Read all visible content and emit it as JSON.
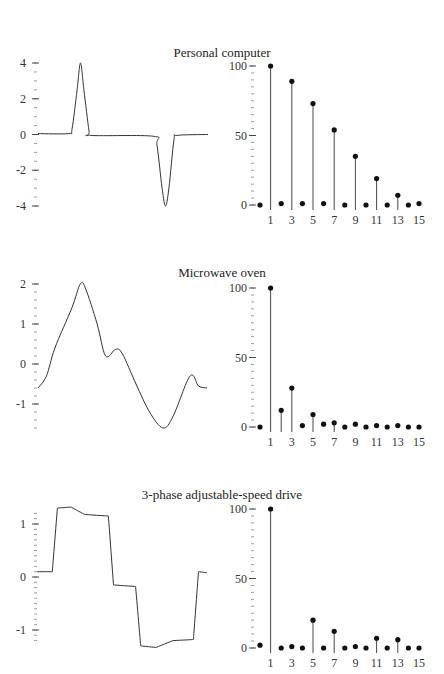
{
  "figure": {
    "panels": [
      {
        "title": "Personal computer"
      },
      {
        "title": "Microwave oven"
      },
      {
        "title": "3-phase adjustable-speed drive"
      }
    ]
  },
  "chart_data": [
    {
      "type": "line",
      "title": "Personal computer — current waveform",
      "xlabel": "",
      "ylabel": "",
      "yticks": [
        4,
        2,
        0,
        -2,
        -4
      ],
      "ylim": [
        -4,
        4
      ],
      "description": "Flat at ~0, sharp positive pulse peaking at ~4 near 25% of the cycle, flat ~0, sharp negative pulse reaching ~-4 near 75% of the cycle, back to 0",
      "points": [
        [
          0,
          0.05
        ],
        [
          0.18,
          0.05
        ],
        [
          0.2,
          0.3
        ],
        [
          0.23,
          2.5
        ],
        [
          0.25,
          4.0
        ],
        [
          0.27,
          2.5
        ],
        [
          0.3,
          0.2
        ],
        [
          0.31,
          -0.05
        ],
        [
          0.68,
          -0.1
        ],
        [
          0.7,
          -0.6
        ],
        [
          0.73,
          -3.0
        ],
        [
          0.75,
          -4.0
        ],
        [
          0.77,
          -3.0
        ],
        [
          0.8,
          -0.3
        ],
        [
          0.82,
          -0.05
        ],
        [
          1.0,
          0
        ]
      ]
    },
    {
      "type": "bar",
      "subtype": "stem",
      "title": "Personal computer — harmonic spectrum",
      "x_ticks": [
        1,
        3,
        5,
        7,
        9,
        11,
        13,
        15
      ],
      "yticks": [
        0,
        50,
        100
      ],
      "ylim": [
        0,
        100
      ],
      "categories": [
        0,
        1,
        2,
        3,
        4,
        5,
        6,
        7,
        8,
        9,
        10,
        11,
        12,
        13,
        14,
        15
      ],
      "values": [
        0,
        100,
        1,
        89,
        1,
        73,
        1,
        54,
        0,
        35,
        0,
        19,
        0,
        7,
        -1,
        1
      ]
    },
    {
      "type": "line",
      "title": "Microwave oven — current waveform",
      "yticks": [
        2,
        1,
        0,
        -1
      ],
      "ylim": [
        -1.6,
        2
      ],
      "description": "Distorted sinusoid: starts ~-0.6, rises to peak ~2, falls to ~0.2 with a small bump to ~0.35, drops to trough ~-1.6, rises to ~-0.3 then dips to ~-0.6",
      "points": [
        [
          0,
          -0.6
        ],
        [
          0.05,
          -0.3
        ],
        [
          0.1,
          0.4
        ],
        [
          0.2,
          1.4
        ],
        [
          0.25,
          2.0
        ],
        [
          0.28,
          1.9
        ],
        [
          0.35,
          1.0
        ],
        [
          0.4,
          0.2
        ],
        [
          0.46,
          0.37
        ],
        [
          0.5,
          0.25
        ],
        [
          0.58,
          -0.5
        ],
        [
          0.66,
          -1.2
        ],
        [
          0.74,
          -1.6
        ],
        [
          0.8,
          -1.3
        ],
        [
          0.9,
          -0.3
        ],
        [
          0.95,
          -0.55
        ],
        [
          1.0,
          -0.6
        ]
      ]
    },
    {
      "type": "bar",
      "subtype": "stem",
      "title": "Microwave oven — harmonic spectrum",
      "x_ticks": [
        1,
        3,
        5,
        7,
        9,
        11,
        13,
        15
      ],
      "yticks": [
        0,
        50,
        100
      ],
      "ylim": [
        0,
        100
      ],
      "categories": [
        0,
        1,
        2,
        3,
        4,
        5,
        6,
        7,
        8,
        9,
        10,
        11,
        12,
        13,
        14,
        15
      ],
      "values": [
        0,
        100,
        12,
        28,
        1,
        9,
        2,
        3,
        0,
        2,
        0,
        1,
        0,
        1,
        0,
        0
      ]
    },
    {
      "type": "line",
      "title": "3-phase adjustable-speed drive — current waveform",
      "yticks": [
        1,
        0,
        -1
      ],
      "ylim": [
        -1.35,
        1.35
      ],
      "description": "Six-step quasi-square wave with ripple: ~0.1, jumps to ~1.3, ~1.2, drops to ~-0.15, then ~-1.35, ~-1.2, back to ~0.1",
      "points": [
        [
          0,
          0.1
        ],
        [
          0.09,
          0.1
        ],
        [
          0.12,
          1.3
        ],
        [
          0.2,
          1.32
        ],
        [
          0.28,
          1.18
        ],
        [
          0.42,
          1.15
        ],
        [
          0.45,
          -0.15
        ],
        [
          0.58,
          -0.18
        ],
        [
          0.61,
          -1.3
        ],
        [
          0.7,
          -1.33
        ],
        [
          0.8,
          -1.2
        ],
        [
          0.92,
          -1.18
        ],
        [
          0.95,
          0.1
        ],
        [
          1.0,
          0.08
        ]
      ]
    },
    {
      "type": "bar",
      "subtype": "stem",
      "title": "3-phase adjustable-speed drive — harmonic spectrum",
      "x_ticks": [
        1,
        3,
        5,
        7,
        9,
        11,
        13,
        15
      ],
      "yticks": [
        0,
        50,
        100
      ],
      "ylim": [
        0,
        100
      ],
      "categories": [
        0,
        1,
        2,
        3,
        4,
        5,
        6,
        7,
        8,
        9,
        10,
        11,
        12,
        13,
        14,
        15
      ],
      "values": [
        2,
        100,
        0,
        1,
        0,
        20,
        0,
        12,
        0,
        1,
        0,
        7,
        0,
        6,
        0,
        0
      ]
    }
  ]
}
